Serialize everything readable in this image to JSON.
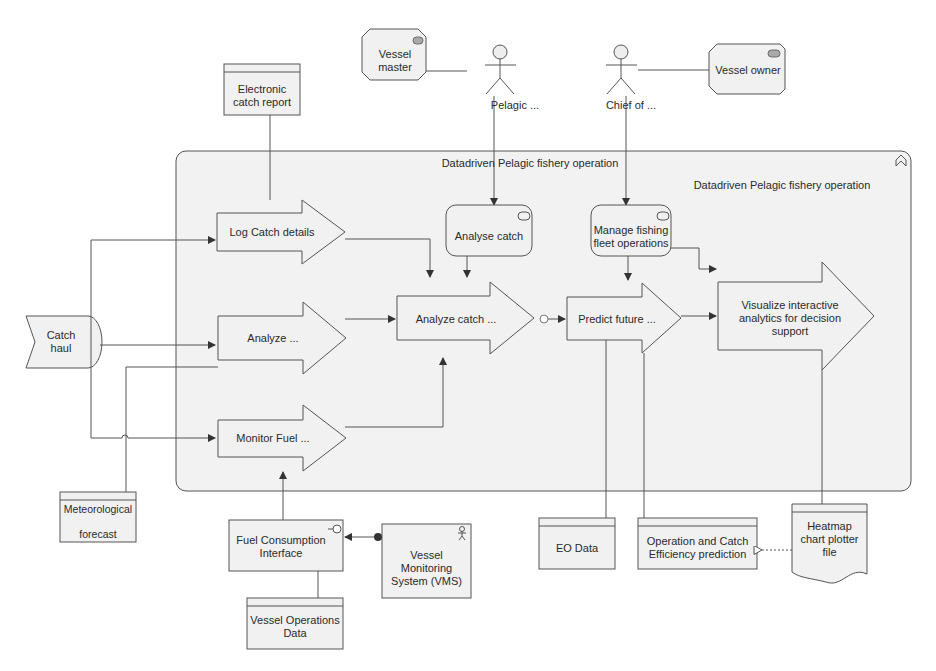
{
  "diagram": {
    "group": {
      "title_top": "Datadriven Pelagic fishery operation",
      "title_inner": "Datadriven Pelagic fishery operation",
      "collapse_icon": "chevron-up-double-icon"
    },
    "roles": {
      "vessel_master": "Vessel master",
      "vessel_owner": "Vessel owner"
    },
    "actors": {
      "pelagic": "Pelagic ...",
      "chief": "Chief of ..."
    },
    "processes": {
      "log_catch": "Log Catch details",
      "analyze": "Analyze ...",
      "monitor_fuel": "Monitor Fuel ...",
      "analyze_catch": "Analyze catch ...",
      "predict_future": "Predict future ...",
      "visualize": "Visualize interactive analytics for decision support"
    },
    "functions": {
      "analyse_catch": "Analyse catch",
      "manage_fleet": "Manage fishing fleet operations"
    },
    "events": {
      "catch_haul": "Catch haul"
    },
    "data_objects": {
      "electronic_catch_report": "Electronic catch report",
      "meteorological_line1": "Meteorological",
      "meteorological_line2": "forecast",
      "vessel_operations_data": "Vessel Operations Data",
      "eo_data": "EO Data",
      "operation_catch_efficiency": "Operation and Catch Efficiency prediction"
    },
    "interfaces": {
      "fuel_consumption": "Fuel Consumption Interface"
    },
    "components": {
      "vms": "Vessel Monitoring System (VMS)"
    },
    "artifacts": {
      "heatmap": "Heatmap chart plotter file"
    }
  }
}
